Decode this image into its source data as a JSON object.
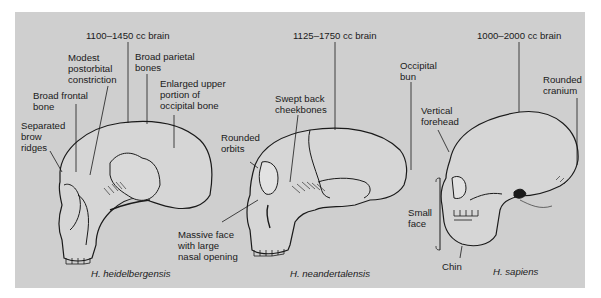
{
  "diagram": {
    "background_color": "#cfcfcf",
    "skulls": [
      {
        "species": "H. heidelbergensis",
        "labels": [
          {
            "id": "brain",
            "text": "1100–1450 cc brain"
          },
          {
            "id": "postorbital",
            "text": "Modest\npostorbital\nconstriction"
          },
          {
            "id": "parietal",
            "text": "Broad parietal\nbones"
          },
          {
            "id": "occipital",
            "text": "Enlarged upper\nportion of\noccipital bone"
          },
          {
            "id": "frontal",
            "text": "Broad frontal\nbone"
          },
          {
            "id": "brow",
            "text": "Separated\nbrow\nridges"
          }
        ]
      },
      {
        "species": "H. neandertalensis",
        "labels": [
          {
            "id": "brain",
            "text": "1125–1750 cc brain"
          },
          {
            "id": "cheekbones",
            "text": "Swept back\ncheekbones"
          },
          {
            "id": "bun",
            "text": "Occipital\nbun"
          },
          {
            "id": "orbits",
            "text": "Rounded\norbits"
          },
          {
            "id": "face",
            "text": "Massive face\nwith large\nnasal opening"
          }
        ]
      },
      {
        "species": "H. sapiens",
        "labels": [
          {
            "id": "brain",
            "text": "1000–2000 cc brain"
          },
          {
            "id": "cranium",
            "text": "Rounded\ncranium"
          },
          {
            "id": "forehead",
            "text": "Vertical\nforehead"
          },
          {
            "id": "face",
            "text": "Small\nface"
          },
          {
            "id": "chin",
            "text": "Chin"
          }
        ]
      }
    ]
  }
}
